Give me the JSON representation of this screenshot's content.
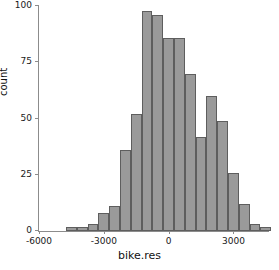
{
  "chart_data": {
    "type": "bar",
    "title": "",
    "xlabel": "bike.res",
    "ylabel": "count",
    "xlim": [
      -6000,
      4600
    ],
    "ylim": [
      0,
      100
    ],
    "grid": false,
    "legend": null,
    "bin_width": 500,
    "x_ticks": [
      -6000,
      -3000,
      0,
      3000
    ],
    "x_tick_labels": [
      "-6000",
      "-3000",
      "0",
      "3000"
    ],
    "y_ticks": [
      0,
      25,
      50,
      75,
      100
    ],
    "y_tick_labels": [
      "0",
      "25",
      "50",
      "75",
      "100"
    ],
    "bins": [
      {
        "left": -4750,
        "right": -4250,
        "center": -4500,
        "count": 2
      },
      {
        "left": -4250,
        "right": -3750,
        "center": -4000,
        "count": 2
      },
      {
        "left": -3750,
        "right": -3250,
        "center": -3500,
        "count": 3
      },
      {
        "left": -3250,
        "right": -2750,
        "center": -3000,
        "count": 8
      },
      {
        "left": -2750,
        "right": -2250,
        "center": -2500,
        "count": 11
      },
      {
        "left": -2250,
        "right": -1750,
        "center": -2000,
        "count": 36
      },
      {
        "left": -1750,
        "right": -1250,
        "center": -1500,
        "count": 52
      },
      {
        "left": -1250,
        "right": -750,
        "center": -1000,
        "count": 98
      },
      {
        "left": -750,
        "right": -250,
        "center": -500,
        "count": 96
      },
      {
        "left": -250,
        "right": 250,
        "center": 0,
        "count": 86
      },
      {
        "left": 250,
        "right": 750,
        "center": 500,
        "count": 86
      },
      {
        "left": 750,
        "right": 1250,
        "center": 1000,
        "count": 70
      },
      {
        "left": 1250,
        "right": 1750,
        "center": 1500,
        "count": 42
      },
      {
        "left": 1750,
        "right": 2250,
        "center": 2000,
        "count": 60
      },
      {
        "left": 2250,
        "right": 2750,
        "center": 2500,
        "count": 49
      },
      {
        "left": 2750,
        "right": 3250,
        "center": 3000,
        "count": 26
      },
      {
        "left": 3250,
        "right": 3750,
        "center": 3500,
        "count": 12
      },
      {
        "left": 3750,
        "right": 4250,
        "center": 4000,
        "count": 3
      },
      {
        "left": 4250,
        "right": 4750,
        "center": 4500,
        "count": 2
      }
    ],
    "colors": {
      "bar_fill": "#9a9a9a",
      "bar_edge": "#5e5e5e",
      "axis": "#8c8c8c",
      "text": "#111111",
      "background": "#ffffff"
    }
  }
}
